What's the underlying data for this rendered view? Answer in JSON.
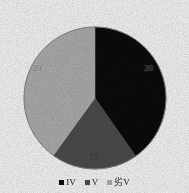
{
  "chart_data": {
    "type": "pie",
    "title": "",
    "subtitle": "",
    "xlabel": "",
    "ylabel": "",
    "grid": false,
    "legend_position": "bottom",
    "categories": [
      "IV",
      "V",
      "劣V"
    ],
    "values": [
      20,
      15,
      20
    ],
    "data_labels": [
      "20",
      "15",
      "20"
    ],
    "start_angle_deg": 0,
    "direction": "clockwise",
    "series": [
      {
        "name": "",
        "values": [
          20,
          15,
          20
        ]
      }
    ],
    "slices": [
      {
        "label": "IV",
        "value": 20,
        "data_label": "20",
        "color": "#0b0b0b",
        "start_angle_deg": 0,
        "end_angle_deg": 145,
        "label_x": 148,
        "label_y": 68,
        "label_tone": "on-dark"
      },
      {
        "label": "V",
        "value": 15,
        "data_label": "15",
        "color": "#4f4f4f",
        "start_angle_deg": 145,
        "end_angle_deg": 216,
        "label_x": 94,
        "label_y": 157,
        "label_tone": "on-mid"
      },
      {
        "label": "劣V",
        "value": 20,
        "data_label": "20",
        "color": "#b4b4b4",
        "start_angle_deg": 216,
        "end_angle_deg": 360,
        "label_x": 37,
        "label_y": 68,
        "label_tone": "on-light"
      }
    ]
  },
  "chart": {
    "center_x": 95,
    "center_y": 98,
    "radius": 71,
    "background": "#ffffff",
    "outline_color": "#8a8a8a"
  },
  "legend": {
    "items": [
      {
        "label": "IV",
        "color": "#0b0b0b"
      },
      {
        "label": "V",
        "color": "#4f4f4f"
      },
      {
        "label": "劣V",
        "color": "#b4b4b4"
      }
    ]
  }
}
